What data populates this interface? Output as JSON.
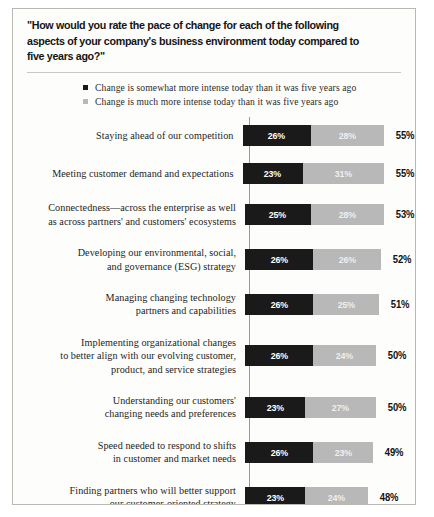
{
  "chart_data": {
    "type": "bar",
    "title": "\"How would you rate the pace of change for each of the following aspects of your company's business environment today compared to five years ago?\"",
    "xlabel": "",
    "ylabel": "",
    "stacked": true,
    "orientation": "horizontal",
    "grid": false,
    "legend_position": "top",
    "xlim": [
      0,
      55
    ],
    "unit": "%",
    "legend": [
      {
        "label": "Change is somewhat more intense today than it was five years ago",
        "color": "#1a1a1a",
        "marker": "square"
      },
      {
        "label": "Change is much more intense today than it was five years ago",
        "color": "#b8b8b8",
        "marker": "square"
      }
    ],
    "series": [
      {
        "name": "Change is somewhat more intense today than it was five years ago",
        "color": "#1a1a1a",
        "values": [
          26,
          23,
          25,
          26,
          26,
          26,
          23,
          26,
          23
        ]
      },
      {
        "name": "Change is much more intense today than it was five years ago",
        "color": "#b8b8b8",
        "values": [
          28,
          31,
          28,
          26,
          25,
          24,
          27,
          23,
          24
        ]
      }
    ],
    "categories": [
      "Staying ahead of our competition",
      "Meeting customer demand and expectations",
      "Connectedness—across the enterprise as well as across partners' and customers' ecosystems",
      "Developing our environmental, social, and governance (ESG) strategy",
      "Managing changing technology partners and capabilities",
      "Implementing organizational changes to better align with our evolving customer, product, and service strategies",
      "Understanding our customers' changing needs and preferences",
      "Speed needed to respond to shifts in customer and market needs",
      "Finding partners who will better support our customer-oriented strategy"
    ],
    "totals": [
      55,
      55,
      53,
      52,
      51,
      50,
      50,
      49,
      48
    ],
    "rows": [
      {
        "label_lines": [
          "Staying ahead of our competition"
        ],
        "dark": 26,
        "light": 28,
        "total": 55,
        "dark_text": "26%",
        "light_text": "28%",
        "total_text": "55%"
      },
      {
        "label_lines": [
          "Meeting customer demand and expectations"
        ],
        "dark": 23,
        "light": 31,
        "total": 55,
        "dark_text": "23%",
        "light_text": "31%",
        "total_text": "55%"
      },
      {
        "label_lines": [
          "Connectedness—across the enterprise as well",
          "as across partners' and customers' ecosystems"
        ],
        "dark": 25,
        "light": 28,
        "total": 53,
        "dark_text": "25%",
        "light_text": "28%",
        "total_text": "53%"
      },
      {
        "label_lines": [
          "Developing our environmental, social,",
          "and governance (ESG) strategy"
        ],
        "dark": 26,
        "light": 26,
        "total": 52,
        "dark_text": "26%",
        "light_text": "26%",
        "total_text": "52%"
      },
      {
        "label_lines": [
          "Managing changing technology",
          "partners and capabilities"
        ],
        "dark": 26,
        "light": 25,
        "total": 51,
        "dark_text": "26%",
        "light_text": "25%",
        "total_text": "51%"
      },
      {
        "label_lines": [
          "Implementing organizational changes",
          "to better align with our evolving customer,",
          "product, and service strategies"
        ],
        "dark": 26,
        "light": 24,
        "total": 50,
        "dark_text": "26%",
        "light_text": "24%",
        "total_text": "50%"
      },
      {
        "label_lines": [
          "Understanding our customers'",
          "changing needs and preferences"
        ],
        "dark": 23,
        "light": 27,
        "total": 50,
        "dark_text": "23%",
        "light_text": "27%",
        "total_text": "50%"
      },
      {
        "label_lines": [
          "Speed needed to respond to shifts",
          "in customer and market needs"
        ],
        "dark": 26,
        "light": 23,
        "total": 49,
        "dark_text": "26%",
        "light_text": "23%",
        "total_text": "49%"
      },
      {
        "label_lines": [
          "Finding partners who will better support",
          "our customer-oriented strategy"
        ],
        "dark": 23,
        "light": 24,
        "total": 48,
        "dark_text": "23%",
        "light_text": "24%",
        "total_text": "48%"
      }
    ]
  }
}
